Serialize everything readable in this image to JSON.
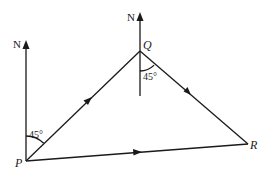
{
  "diagram": {
    "points": {
      "P": {
        "label": "P",
        "x": 26,
        "y": 161
      },
      "Q": {
        "label": "Q",
        "x": 140,
        "y": 51
      },
      "R": {
        "label": "R",
        "x": 248,
        "y": 144
      }
    },
    "north_labels": {
      "at_P": "N",
      "at_Q": "N"
    },
    "angles": {
      "at_P": "45°",
      "at_Q": "45°"
    },
    "line_color": "#1a1a1a"
  }
}
